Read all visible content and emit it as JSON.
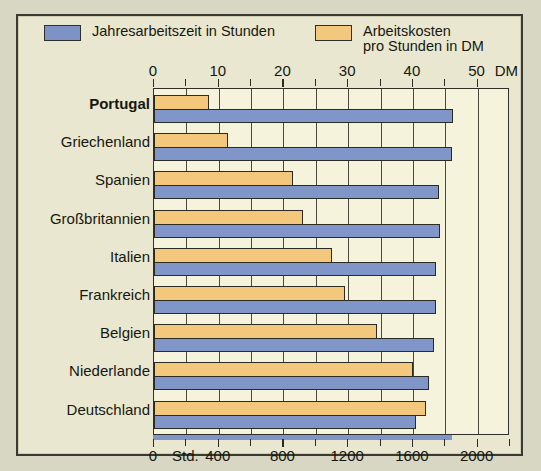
{
  "legend": {
    "hours": {
      "label": "Jahresarbeitszeit in Stunden",
      "color": "#7d93c6"
    },
    "cost": {
      "line1": "Arbeitskosten",
      "line2": "pro Stunden in DM",
      "color": "#f4c87c"
    }
  },
  "axes": {
    "top": {
      "unit": "DM",
      "ticks": [
        "0",
        "10",
        "20",
        "30",
        "40",
        "50"
      ],
      "min": 0,
      "max": 55,
      "step": 10,
      "minor_step": 5
    },
    "bottom": {
      "unit": "Std.",
      "ticks": [
        "0",
        "400",
        "800",
        "1200",
        "1600",
        "2000"
      ],
      "min": 0,
      "max": 2200,
      "step": 400,
      "minor_step": 200
    }
  },
  "chart_data": {
    "type": "bar",
    "orientation": "horizontal",
    "title": "",
    "categories": [
      "Portugal",
      "Griechenland",
      "Spanien",
      "Großbritannien",
      "Italien",
      "Frankreich",
      "Belgien",
      "Niederlande",
      "Deutschland"
    ],
    "highlight_category": "Portugal",
    "series": [
      {
        "name": "Arbeitskosten pro Stunden in DM",
        "key": "cost",
        "unit": "DM",
        "axis": "top",
        "color": "#f4c87c",
        "values": [
          8.5,
          11.5,
          21.5,
          23,
          27.5,
          29.5,
          34.5,
          40,
          42
        ]
      },
      {
        "name": "Jahresarbeitszeit in Stunden",
        "key": "hours",
        "unit": "Std.",
        "axis": "bottom",
        "color": "#8096c8",
        "values": [
          1850,
          1840,
          1760,
          1770,
          1740,
          1740,
          1730,
          1700,
          1620
        ]
      }
    ],
    "xlabel": "",
    "ylabel": "",
    "grid": true,
    "legend_position": "top"
  }
}
